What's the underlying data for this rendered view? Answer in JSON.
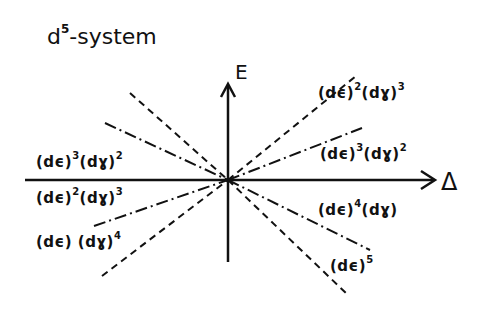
{
  "title": {
    "base": "d",
    "sup": "5",
    "rest": "-system"
  },
  "axes": {
    "vertical_label": "E",
    "horizontal_label": "Δ"
  },
  "labels": [
    {
      "id": "upper-right-dashed",
      "parts": [
        {
          "t": "(dϵ)",
          "s": "2"
        },
        {
          "t": "(dɣ)",
          "s": "3"
        }
      ]
    },
    {
      "id": "upper-right-dashdot",
      "parts": [
        {
          "t": "(dϵ)",
          "s": "3"
        },
        {
          "t": "(dɣ)",
          "s": "2"
        }
      ]
    },
    {
      "id": "lower-right-dashdot",
      "parts": [
        {
          "t": "(dϵ)",
          "s": "4"
        },
        {
          "t": "(dɣ)",
          "s": ""
        }
      ]
    },
    {
      "id": "lower-right-dashed",
      "parts": [
        {
          "t": "(dϵ)",
          "s": "5"
        }
      ]
    },
    {
      "id": "upper-left-dashdot",
      "parts": [
        {
          "t": "(dϵ)",
          "s": "3"
        },
        {
          "t": "(dɣ)",
          "s": "2"
        }
      ]
    },
    {
      "id": "lower-left-dashdot",
      "parts": [
        {
          "t": "(dϵ)",
          "s": "2"
        },
        {
          "t": "(dɣ)",
          "s": "3"
        }
      ]
    },
    {
      "id": "lower-left-dashed",
      "parts": [
        {
          "t": "(dϵ) ",
          "s": ""
        },
        {
          "t": "(dɣ)",
          "s": "4"
        }
      ]
    }
  ],
  "colors": {
    "ink": "#111111",
    "background": "#ffffff"
  }
}
